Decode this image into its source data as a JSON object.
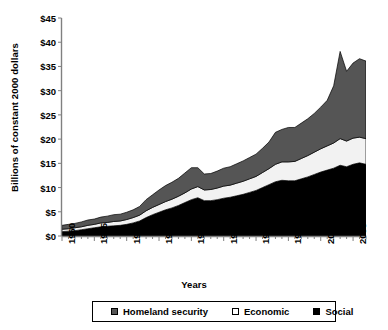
{
  "chart_data": {
    "type": "area",
    "stacked": true,
    "title": "",
    "xlabel": "Years",
    "ylabel": "Billions of constant 2000 dollars",
    "xlim": [
      1960,
      2007
    ],
    "ylim": [
      0,
      45
    ],
    "ytick_step": 5,
    "xtick_step": 5,
    "grid": false,
    "legend_position": "bottom",
    "ytick_labels": [
      "$45",
      "$40",
      "$35",
      "$30",
      "$25",
      "$20",
      "$15",
      "$10",
      "$5",
      "$0"
    ],
    "ytick_values": [
      45,
      40,
      35,
      30,
      25,
      20,
      15,
      10,
      5,
      0
    ],
    "xtick_labels": [
      "1960",
      "1965",
      "1970",
      "1975",
      "1980",
      "1985",
      "1990",
      "1995",
      "2000",
      "2005"
    ],
    "xtick_values": [
      1960,
      1965,
      1970,
      1975,
      1980,
      1985,
      1990,
      1995,
      2000,
      2005
    ],
    "x": [
      1960,
      1961,
      1962,
      1963,
      1964,
      1965,
      1966,
      1967,
      1968,
      1969,
      1970,
      1971,
      1972,
      1973,
      1974,
      1975,
      1976,
      1977,
      1978,
      1979,
      1980,
      1981,
      1982,
      1983,
      1984,
      1985,
      1986,
      1987,
      1988,
      1989,
      1990,
      1991,
      1992,
      1993,
      1994,
      1995,
      1996,
      1997,
      1998,
      1999,
      2000,
      2001,
      2002,
      2003,
      2004,
      2005,
      2006,
      2007
    ],
    "series": [
      {
        "name": "Social",
        "color": "#000000",
        "values": [
          0.9,
          1.0,
          1.1,
          1.3,
          1.5,
          1.7,
          1.9,
          2.0,
          2.1,
          2.2,
          2.4,
          2.7,
          3.1,
          3.8,
          4.4,
          4.9,
          5.4,
          5.8,
          6.3,
          6.9,
          7.5,
          7.9,
          7.3,
          7.3,
          7.5,
          7.8,
          8.0,
          8.3,
          8.6,
          9.0,
          9.4,
          10.0,
          10.6,
          11.2,
          11.5,
          11.4,
          11.4,
          11.8,
          12.2,
          12.7,
          13.2,
          13.6,
          14.0,
          14.6,
          14.3,
          14.8,
          15.1,
          14.8
        ]
      },
      {
        "name": "Economic",
        "color": "#f2f2f2",
        "values": [
          0.5,
          0.5,
          0.6,
          0.6,
          0.7,
          0.7,
          0.8,
          0.8,
          0.9,
          0.9,
          1.0,
          1.1,
          1.2,
          1.4,
          1.5,
          1.6,
          1.7,
          1.8,
          1.9,
          2.0,
          2.2,
          2.3,
          2.2,
          2.3,
          2.4,
          2.5,
          2.5,
          2.6,
          2.7,
          2.8,
          2.9,
          3.1,
          3.3,
          3.6,
          3.8,
          3.9,
          4.0,
          4.2,
          4.4,
          4.6,
          4.8,
          5.0,
          5.2,
          5.5,
          5.3,
          5.4,
          5.3,
          5.3
        ]
      },
      {
        "name": "Homeland security",
        "color": "#555555",
        "values": [
          0.8,
          0.9,
          0.9,
          1.0,
          1.1,
          1.1,
          1.2,
          1.3,
          1.4,
          1.4,
          1.5,
          1.6,
          1.8,
          2.3,
          2.6,
          3.0,
          3.3,
          3.5,
          3.7,
          4.1,
          4.4,
          3.9,
          3.3,
          3.3,
          3.5,
          3.7,
          3.8,
          4.0,
          4.2,
          4.4,
          4.6,
          5.0,
          5.5,
          6.6,
          6.7,
          7.1,
          7.0,
          7.3,
          7.6,
          8.0,
          8.6,
          9.4,
          11.8,
          18.0,
          14.4,
          15.5,
          16.2,
          16.0
        ]
      }
    ],
    "annotations": [
      {
        "text": "Peak total near $38B in 2003",
        "x": 2003,
        "y": 38.1
      }
    ]
  },
  "legend": {
    "items": [
      {
        "label": "Homeland security",
        "swatch": "#555555"
      },
      {
        "label": "Economic",
        "swatch": "#ffffff"
      },
      {
        "label": "Social",
        "swatch": "#000000"
      }
    ]
  }
}
